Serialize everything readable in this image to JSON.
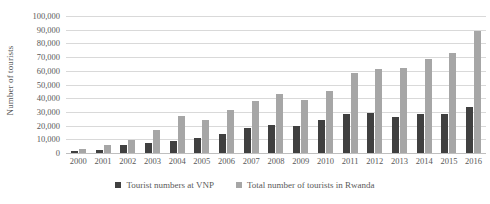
{
  "chart_data": {
    "type": "bar",
    "title": "",
    "xlabel": "",
    "ylabel": "Number of tourists",
    "ylim": [
      0,
      100000
    ],
    "ytick_step": 10000,
    "grid": true,
    "legend_position": "bottom",
    "categories": [
      "2000",
      "2001",
      "2002",
      "2003",
      "2004",
      "2005",
      "2006",
      "2007",
      "2008",
      "2009",
      "2010",
      "2011",
      "2012",
      "2013",
      "2014",
      "2015",
      "2016"
    ],
    "ytick_labels": [
      "100,000",
      "90,000",
      "80,000",
      "70,000",
      "60,000",
      "50,000",
      "40,000",
      "30,000",
      "20,000",
      "10,000",
      "0"
    ],
    "ytick_values": [
      100000,
      90000,
      80000,
      70000,
      60000,
      50000,
      40000,
      30000,
      20000,
      10000,
      0
    ],
    "series": [
      {
        "name": "Tourist numbers at VNP",
        "color": "#404040",
        "values": [
          1200,
          2000,
          5500,
          7300,
          8600,
          10700,
          14000,
          18300,
          20300,
          19500,
          23900,
          28200,
          29200,
          26000,
          28700,
          28200,
          33700
        ]
      },
      {
        "name": "Total number of tourists in Rwanda",
        "color": "#a6a6a6",
        "values": [
          2900,
          5500,
          9800,
          16500,
          27000,
          24300,
          31300,
          38300,
          43300,
          39000,
          45500,
          58500,
          61500,
          62000,
          68400,
          73200,
          88800
        ]
      }
    ]
  },
  "legend": {
    "items": [
      {
        "label": "Tourist numbers at VNP",
        "color": "#404040",
        "marker": "square-marker"
      },
      {
        "label": "Total number of tourists in Rwanda",
        "color": "#a6a6a6",
        "marker": "square-marker"
      }
    ]
  }
}
